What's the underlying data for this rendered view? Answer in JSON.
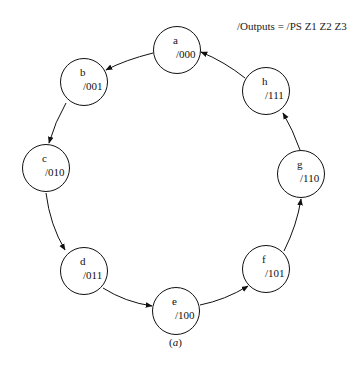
{
  "legend": "/Outputs  =  /PS Z1 Z2 Z3",
  "caption": {
    "open": "(",
    "label": "a",
    "close": ")"
  },
  "states": [
    {
      "name": "a",
      "output": "/000",
      "cx": 177,
      "cy": 50
    },
    {
      "name": "b",
      "output": "/001",
      "cx": 84,
      "cy": 82
    },
    {
      "name": "c",
      "output": "/010",
      "cx": 46,
      "cy": 168
    },
    {
      "name": "d",
      "output": "/011",
      "cx": 84,
      "cy": 271
    },
    {
      "name": "e",
      "output": "/100",
      "cx": 176,
      "cy": 311
    },
    {
      "name": "f",
      "output": "/101",
      "cx": 266,
      "cy": 269
    },
    {
      "name": "g",
      "output": "/110",
      "cx": 301,
      "cy": 174
    },
    {
      "name": "h",
      "output": "/111",
      "cx": 266,
      "cy": 91
    }
  ],
  "transitions": [
    {
      "from": "a",
      "to": "b"
    },
    {
      "from": "b",
      "to": "c"
    },
    {
      "from": "c",
      "to": "d"
    },
    {
      "from": "d",
      "to": "e"
    },
    {
      "from": "e",
      "to": "f"
    },
    {
      "from": "f",
      "to": "g"
    },
    {
      "from": "g",
      "to": "h"
    },
    {
      "from": "h",
      "to": "a"
    }
  ],
  "colors": {
    "stroke": "#111111",
    "background": "#ffffff"
  }
}
